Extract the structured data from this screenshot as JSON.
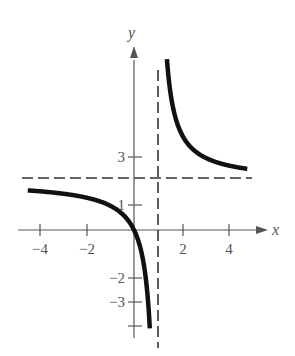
{
  "chart_data": {
    "type": "line",
    "title": "",
    "xlabel": "x",
    "ylabel": "y",
    "function": "y = 2x/(x-1)",
    "xlim": [
      -4.7,
      5.8
    ],
    "ylim": [
      -4.3,
      5.6
    ],
    "x_ticks": [
      -4,
      -2,
      2,
      4
    ],
    "x_tick_labels": [
      "−4",
      "−2",
      "2",
      "4"
    ],
    "y_ticks": [
      1,
      3,
      -2,
      -3,
      -4
    ],
    "y_tick_labels": [
      "1",
      "3",
      "−2",
      "−3",
      ""
    ],
    "asymptotes": {
      "vertical": 1,
      "horizontal": 2
    },
    "series": [
      {
        "name": "left branch",
        "x": [
          -4.5,
          -4,
          -3,
          -2,
          -1,
          -0.5,
          0,
          0.25,
          0.5,
          0.6,
          0.67
        ],
        "y": [
          1.64,
          1.6,
          1.5,
          1.33,
          1.0,
          0.67,
          0.0,
          -0.67,
          -2.0,
          -3.0,
          -4.06
        ]
      },
      {
        "name": "right branch",
        "x": [
          1.4,
          1.5,
          2,
          3,
          4,
          4.8
        ],
        "y": [
          7.0,
          6.0,
          4.0,
          3.0,
          2.67,
          2.53
        ]
      }
    ],
    "grid": false,
    "legend": null
  },
  "labels": {
    "x_axis": "x",
    "y_axis": "y",
    "xt_m4": "−4",
    "xt_m2": "−2",
    "xt_2": "2",
    "xt_4": "4",
    "yt_1": "1",
    "yt_3": "3",
    "yt_m2": "−2",
    "yt_m3": "−3"
  }
}
